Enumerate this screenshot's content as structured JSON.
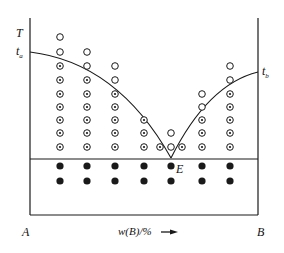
{
  "diagram": {
    "axis_y_label": "T",
    "axis_x_label": "w(B)/%",
    "left_component": "A",
    "right_component": "B",
    "ta_label": "t",
    "ta_sub": "a",
    "tb_label": "t",
    "tb_sub": "b",
    "eutectic_label": "E",
    "colors": {
      "line": "#1a1a1a",
      "background": "#ffffff"
    },
    "legend_symbols": {
      "open-circle": "liquid",
      "dotted-circle": "liquid + solid",
      "filled-circle": "solid"
    },
    "columns": [
      {
        "x": 60,
        "open": [
          37,
          52
        ],
        "dotted": [
          66,
          80,
          94,
          107,
          120,
          133,
          147
        ],
        "filled": [
          166,
          181
        ]
      },
      {
        "x": 87,
        "open": [
          52,
          66
        ],
        "dotted": [
          80,
          94,
          107,
          120,
          133,
          147
        ],
        "filled": [
          166,
          181
        ]
      },
      {
        "x": 115,
        "open": [
          66,
          80
        ],
        "dotted": [
          94,
          107,
          120,
          133,
          147
        ],
        "filled": [
          166,
          181
        ]
      },
      {
        "x": 144,
        "open": [],
        "dotted": [
          120,
          133,
          147
        ],
        "filled": [
          166,
          181
        ]
      },
      {
        "x": 160,
        "open": [],
        "dotted": [
          147
        ],
        "filled": []
      },
      {
        "x": 171,
        "open": [
          133,
          147
        ],
        "dotted": [],
        "filled": [
          166,
          181
        ]
      },
      {
        "x": 182,
        "open": [],
        "dotted": [
          147
        ],
        "filled": []
      },
      {
        "x": 202,
        "open": [
          94,
          107
        ],
        "dotted": [
          120,
          133,
          147
        ],
        "filled": [
          166,
          181
        ]
      },
      {
        "x": 230,
        "open": [
          66,
          80
        ],
        "dotted": [
          94,
          107,
          120,
          133,
          147
        ],
        "filled": [
          166,
          181
        ]
      }
    ]
  }
}
